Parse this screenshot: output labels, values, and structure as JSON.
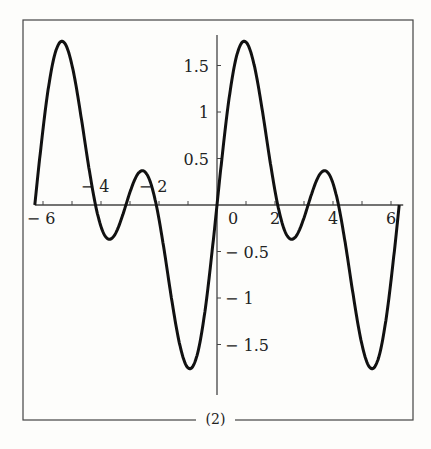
{
  "caption": "(2)",
  "chart_data": {
    "type": "line",
    "title": "",
    "function": "sin(x) + sin(2x)",
    "xlabel": "",
    "ylabel": "",
    "xlim": [
      -6.2832,
      6.2832
    ],
    "ylim": [
      -1.9,
      1.9
    ],
    "grid": false,
    "x_ticks": [
      -6,
      -4,
      -2,
      0,
      2,
      4,
      6
    ],
    "x_tick_labels": [
      "-6",
      "-4",
      "-2",
      "0",
      "2",
      "4",
      "6"
    ],
    "y_ticks": [
      -1.5,
      -1,
      -0.5,
      0.5,
      1,
      1.5
    ],
    "y_tick_labels": [
      "-1.5",
      "-1",
      "-0.5",
      "0.5",
      "1",
      "1.5"
    ],
    "series": [
      {
        "name": "f(x)",
        "x": [
          -6.28,
          -5.35,
          -4.33,
          -3.7,
          -3.14,
          -2.56,
          -0.94,
          0,
          0.94,
          2.09,
          2.56,
          3.14,
          3.7,
          4.19,
          5.35,
          6.28
        ],
        "values": [
          0,
          1.76,
          -0.37,
          0.37,
          0,
          -0.37,
          -1.76,
          0,
          1.76,
          0,
          -0.37,
          0,
          0.37,
          0,
          -1.76,
          0
        ]
      }
    ]
  }
}
